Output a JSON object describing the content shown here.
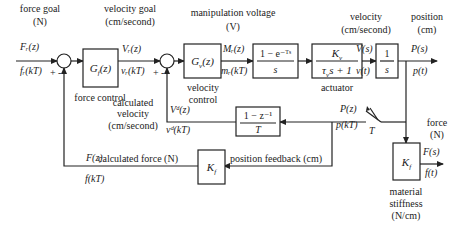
{
  "diagram": {
    "type": "block-diagram",
    "labels": {
      "force_goal": [
        "force goal",
        "(N)"
      ],
      "velocity_goal": [
        "velocity goal",
        "(cm/second)"
      ],
      "manipulation_voltage": [
        "manipulation voltage",
        "(V)"
      ],
      "velocity": [
        "velocity",
        "(cm/second)"
      ],
      "position": [
        "position",
        "(cm)"
      ],
      "force_control": "force control",
      "velocity_control": [
        "velocity",
        "control"
      ],
      "actuator": "actuator",
      "calculated_velocity": [
        "calculated",
        "velocity",
        "(cm/second)"
      ],
      "calculated_force": "calculated force (N)",
      "position_feedback": "position feedback (cm)",
      "force_out": [
        "force",
        "(N)"
      ],
      "material_stiffness": [
        "material",
        "stiffness",
        "(N/cm)"
      ]
    },
    "signals": {
      "Fr_z": "Fᵣ(z)",
      "fr_kT": "fᵣ(kT)",
      "Vr_z": "Vᵣ(z)",
      "vr_kT": "vᵣ(kT)",
      "Mr_z": "Mᵣ(z)",
      "mr_kT": "mᵣ(kT)",
      "V_s": "V(s)",
      "v_t": "v(t)",
      "P_s": "P(s)",
      "p_t": "p(t)",
      "P_z": "P(z)",
      "p_kT": "p(kT)",
      "T": "T",
      "Vd_z": "Vᵈ(z)",
      "vd_kT": "vᵈ(kT)",
      "F_z": "F(z)",
      "f_kT": "f(kT)",
      "F_s": "F(s)",
      "f_t": "f(t)"
    },
    "blocks": {
      "Gf": "G_f(z)",
      "Gv": "G_v(z)",
      "zoh_num": "1 − e⁻ᵀˢ",
      "zoh_den": "s",
      "act_num": "K_v",
      "act_den": "τ_v s + 1",
      "int_num": "1",
      "int_den": "s",
      "diff_num": "1 − z⁻¹",
      "diff_den": "T",
      "Kf_feedback": "K_f",
      "Kf_material": "K_f"
    },
    "summing_signs": {
      "plus": "+",
      "minus": "-"
    }
  }
}
